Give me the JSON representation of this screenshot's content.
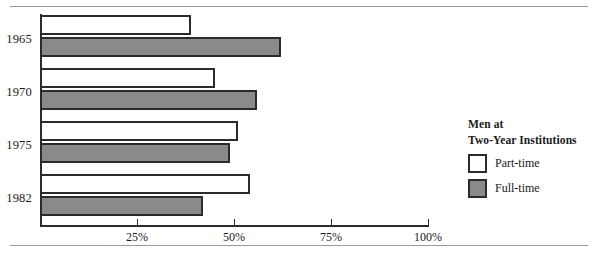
{
  "chart_data": {
    "type": "bar",
    "orientation": "horizontal",
    "title": "",
    "xlabel": "",
    "ylabel": "",
    "categories": [
      "1965",
      "1970",
      "1975",
      "1982"
    ],
    "series": [
      {
        "name": "Part-time",
        "color": "#ffffff",
        "values": [
          39,
          45,
          51,
          54
        ]
      },
      {
        "name": "Full-time",
        "color": "#8a8a8a",
        "values": [
          62,
          56,
          49,
          42
        ]
      }
    ],
    "xlim": [
      0,
      100
    ],
    "xticks": [
      25,
      50,
      75,
      100
    ],
    "xtick_labels": [
      "25%",
      "50%",
      "75%",
      "100%"
    ],
    "grid": false,
    "legend_position": "right"
  },
  "legend": {
    "title_line1": "Men at",
    "title_line2": "Two-Year Institutions",
    "entries": [
      {
        "label": "Part-time",
        "swatch": "white"
      },
      {
        "label": "Full-time",
        "swatch": "gray"
      }
    ]
  },
  "colors": {
    "full_time_fill": "#8a8a8a",
    "part_time_fill": "#ffffff",
    "outline": "#2b2b2b",
    "rule": "#9a9a9a"
  }
}
